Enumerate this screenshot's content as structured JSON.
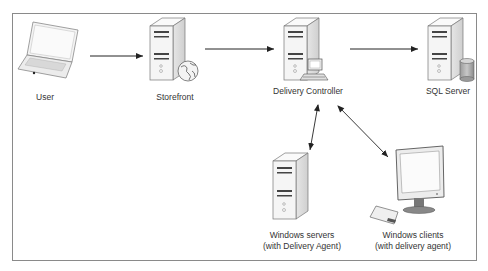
{
  "diagram": {
    "nodes": [
      {
        "id": "user",
        "label": "User",
        "icon": "laptop-icon"
      },
      {
        "id": "storefront",
        "label": "Storefront",
        "icon": "server-globe-icon"
      },
      {
        "id": "delivery_controller",
        "label": "Delivery Controller",
        "icon": "server-computer-icon"
      },
      {
        "id": "sql_server",
        "label": "SQL Server",
        "icon": "server-database-icon"
      },
      {
        "id": "windows_servers",
        "label_line1": "Windows servers",
        "label_line2": "(with Delivery Agent)",
        "icon": "server-icon"
      },
      {
        "id": "windows_clients",
        "label_line1": "Windows clients",
        "label_line2": "(with delivery agent)",
        "icon": "desktop-computer-icon"
      }
    ],
    "edges": [
      {
        "from": "user",
        "to": "storefront",
        "direction": "one-way"
      },
      {
        "from": "storefront",
        "to": "delivery_controller",
        "direction": "one-way"
      },
      {
        "from": "delivery_controller",
        "to": "sql_server",
        "direction": "one-way"
      },
      {
        "from": "delivery_controller",
        "to": "windows_servers",
        "direction": "two-way"
      },
      {
        "from": "delivery_controller",
        "to": "windows_clients",
        "direction": "two-way"
      }
    ],
    "colors": {
      "border": "#8a8a8a",
      "arrow": "#222222",
      "server_body": "#f2f2f2",
      "server_outline": "#777777",
      "text": "#333333"
    }
  }
}
